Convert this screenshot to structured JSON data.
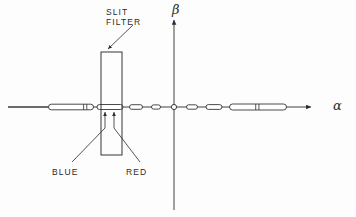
{
  "figure": {
    "background": "#fdfdfd",
    "ink": "#2b2b2b",
    "width": 356,
    "height": 217
  },
  "axes": {
    "horizontal": {
      "name": "alpha-axis",
      "label": "α",
      "label_x": 333,
      "label_y": 99,
      "y": 107,
      "x_start": 8,
      "x_end": 311,
      "arrow": "right"
    },
    "vertical": {
      "name": "beta-axis",
      "label": "β",
      "label_x": 172,
      "label_y": 3,
      "x": 174,
      "y_start": 20,
      "y_end": 210,
      "arrow": "up"
    },
    "origin": {
      "label": "origin-marker",
      "x": 174,
      "y": 107,
      "radius": 2.6,
      "filled": false
    }
  },
  "annotations": [
    {
      "id": "slit-filter",
      "text": "SLIT\nFILTER",
      "lines": [
        "SLIT",
        "FILTER"
      ],
      "text_x": 106,
      "text_y": 8,
      "leader": {
        "x1": 133,
        "y1": 25,
        "x2": 108,
        "y2": 49
      }
    },
    {
      "id": "blue",
      "text": "BLUE",
      "text_x": 52,
      "text_y": 168,
      "leader": {
        "x1": 72,
        "y1": 162,
        "x2": 105,
        "y2": 128
      },
      "pointer": {
        "x": 105,
        "y1": 128,
        "y2": 112
      }
    },
    {
      "id": "red",
      "text": "RED",
      "text_x": 126,
      "text_y": 168,
      "leader": {
        "x1": 140,
        "y1": 162,
        "x2": 114,
        "y2": 128
      },
      "pointer": {
        "x": 114,
        "y1": 128,
        "y2": 112
      }
    }
  ],
  "slit_filter_rect": {
    "name": "slit-filter-rectangle",
    "x": 101,
    "y": 52,
    "width": 21,
    "height": 103
  },
  "plain_segment": {
    "name": "axis-left-stub",
    "x1": 8,
    "y": 107,
    "x2": 48
  },
  "chart_data": {
    "type": "scatter",
    "xlabel": "α",
    "ylabel": "β",
    "grid": false,
    "legend": null,
    "origin_value": [
      0,
      0
    ],
    "marker_shape": "elongated-capsule",
    "note": "Each marker is a horizontal capsule (spectral line image); length grows with distance from the origin. Markers left of the origin pass through the slit filter.",
    "markers": [
      {
        "id": "m1",
        "cx": 71,
        "cy": 107,
        "length": 45,
        "height": 5.6,
        "side": "left",
        "divider_at": 0.78
      },
      {
        "id": "m2",
        "cx": 110,
        "cy": 107,
        "length": 26,
        "height": 5.0,
        "side": "left",
        "divider_at": null
      },
      {
        "id": "m3",
        "cx": 136,
        "cy": 107,
        "length": 13,
        "height": 4.6,
        "side": "left",
        "divider_at": null
      },
      {
        "id": "m4",
        "cx": 156,
        "cy": 107,
        "length": 9,
        "height": 4.2,
        "side": "left",
        "divider_at": null
      },
      {
        "id": "m5",
        "cx": 192,
        "cy": 107,
        "length": 11,
        "height": 4.4,
        "side": "right",
        "divider_at": null
      },
      {
        "id": "m6",
        "cx": 214,
        "cy": 107,
        "length": 16,
        "height": 4.8,
        "side": "right",
        "divider_at": null
      },
      {
        "id": "m7",
        "cx": 258,
        "cy": 107,
        "length": 57,
        "height": 6.0,
        "side": "right",
        "divider_at": 0.46
      }
    ]
  }
}
